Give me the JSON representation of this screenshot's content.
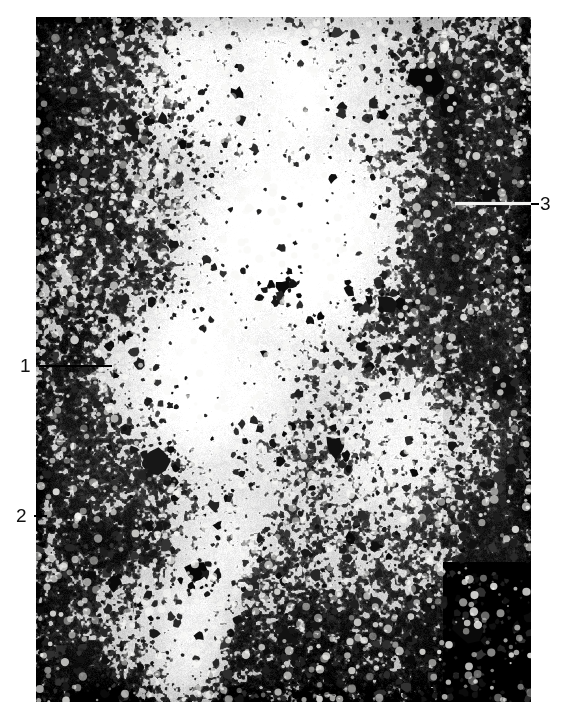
{
  "figure": {
    "type": "photomicrograph",
    "background_color": "#ffffff",
    "plate": {
      "left": 36,
      "top": 17,
      "width": 495,
      "height": 685,
      "tone_light": "#f0efec",
      "tone_mid": "#8d8d8a",
      "tone_dark": "#121212"
    },
    "callouts": [
      {
        "id": "callout-1",
        "label": "1",
        "line_color": "#000000",
        "line_style": "solid-black",
        "side": "left",
        "points_to": "pale vacuolated / necrotic zone at mid-left of field"
      },
      {
        "id": "callout-2",
        "label": "2",
        "line_color": "#000000",
        "line_style": "short-tick-black",
        "side": "left",
        "points_to": "dense dark cellular infiltrate at lower-left margin"
      },
      {
        "id": "callout-3",
        "label": "3",
        "line_color": "#f4f4f2",
        "line_style": "solid-white-inside-plate",
        "side": "right",
        "points_to": "dark granular focus in upper-right quadrant"
      }
    ]
  }
}
